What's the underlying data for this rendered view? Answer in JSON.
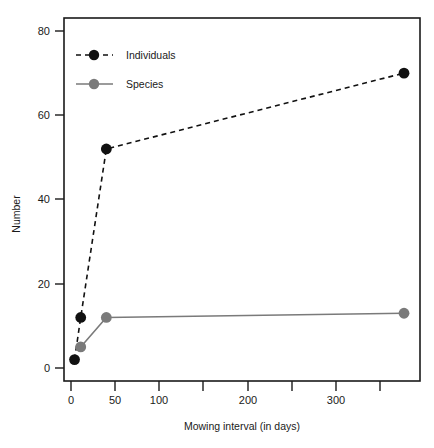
{
  "chart_data": {
    "type": "line",
    "title": "",
    "subtitle": "",
    "xlabel": "Mowing interval (in days)",
    "ylabel": "Number",
    "xlim": [
      -6,
      396
    ],
    "ylim": [
      -3,
      84
    ],
    "xticks": [
      0,
      50,
      100,
      150,
      200,
      250,
      300,
      350
    ],
    "xtick_labels": [
      "0",
      "50",
      "100",
      "",
      "200",
      "",
      "300",
      ""
    ],
    "yticks": [
      0,
      20,
      40,
      60,
      80
    ],
    "ytick_labels": [
      "0",
      "20",
      "40",
      "60",
      "80"
    ],
    "grid": false,
    "legend_position": "top-left",
    "series": [
      {
        "name": "Individuals",
        "color": "#111111",
        "line_style": "dashed",
        "marker": "filled-circle",
        "x": [
          4,
          11,
          40,
          377
        ],
        "values": [
          2,
          12,
          52,
          70
        ]
      },
      {
        "name": "Species",
        "color": "#7a7a7a",
        "line_style": "solid",
        "marker": "filled-circle",
        "x": [
          11,
          40,
          377
        ],
        "values": [
          5,
          12,
          13
        ]
      }
    ]
  },
  "legend": {
    "items": [
      {
        "label": "Individuals",
        "color": "#111111",
        "line_style": "dashed"
      },
      {
        "label": "Species",
        "color": "#7a7a7a",
        "line_style": "solid"
      }
    ]
  },
  "axes": {
    "x_title": "Mowing interval (in days)",
    "y_title": "Number",
    "x_tick_0": "0",
    "x_tick_50": "50",
    "x_tick_100": "100",
    "x_tick_200": "200",
    "x_tick_300": "300",
    "y_tick_0": "0",
    "y_tick_20": "20",
    "y_tick_40": "40",
    "y_tick_60": "60",
    "y_tick_80": "80"
  }
}
